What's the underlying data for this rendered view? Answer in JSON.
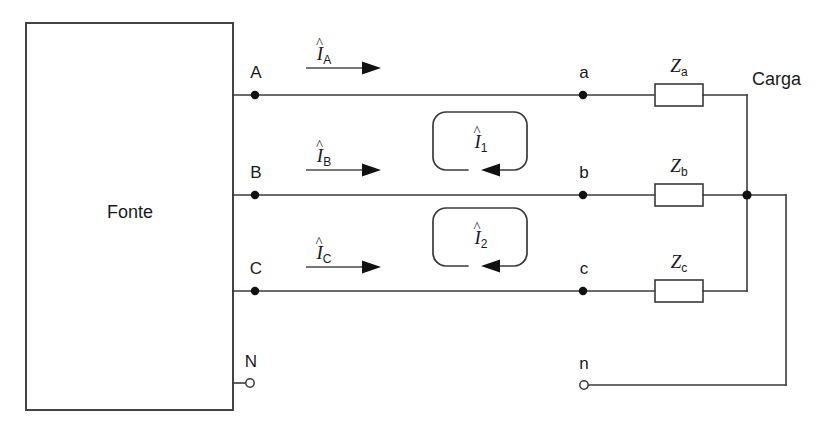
{
  "diagram": {
    "type": "three-phase source-load circuit schematic",
    "source_block": {
      "label": "Fonte",
      "terminals": [
        {
          "name": "A",
          "kind": "filled-node",
          "x": 255,
          "y": 95
        },
        {
          "name": "B",
          "kind": "filled-node",
          "x": 255,
          "y": 195
        },
        {
          "name": "C",
          "kind": "filled-node",
          "x": 255,
          "y": 291
        },
        {
          "name": "N",
          "kind": "open-terminal",
          "x": 250,
          "y": 383
        }
      ]
    },
    "load_block": {
      "label": "Carga",
      "terminals": [
        {
          "name": "a",
          "kind": "filled-node",
          "x": 583,
          "y": 95
        },
        {
          "name": "b",
          "kind": "filled-node",
          "x": 583,
          "y": 195
        },
        {
          "name": "c",
          "kind": "filled-node",
          "x": 583,
          "y": 291
        },
        {
          "name": "n",
          "kind": "open-terminal",
          "x": 582,
          "y": 385
        }
      ],
      "impedances": [
        {
          "symbol": "Z",
          "subscript": "a",
          "line": "a"
        },
        {
          "symbol": "Z",
          "subscript": "b",
          "line": "b"
        },
        {
          "symbol": "Z",
          "subscript": "c",
          "line": "c"
        }
      ]
    },
    "line_currents": [
      {
        "symbol": "I",
        "subscript": "A",
        "hat": "^",
        "direction": "right",
        "line": "A"
      },
      {
        "symbol": "I",
        "subscript": "B",
        "hat": "^",
        "direction": "right",
        "line": "B"
      },
      {
        "symbol": "I",
        "subscript": "C",
        "hat": "^",
        "direction": "right",
        "line": "C"
      }
    ],
    "mesh_currents": [
      {
        "symbol": "I",
        "subscript": "1",
        "hat": "^",
        "sense": "clockwise",
        "between_lines": "A-B"
      },
      {
        "symbol": "I",
        "subscript": "2",
        "hat": "^",
        "sense": "clockwise",
        "between_lines": "B-C"
      }
    ],
    "labels": {
      "source": "Fonte",
      "load": "Carga",
      "node_A": "A",
      "node_B": "B",
      "node_C": "C",
      "node_N": "N",
      "node_a": "a",
      "node_b": "b",
      "node_c": "c",
      "node_n": "n",
      "Z": "Z",
      "Za_sub": "a",
      "Zb_sub": "b",
      "Zc_sub": "c",
      "I": "I",
      "hat": "^",
      "IA_sub": "A",
      "IB_sub": "B",
      "IC_sub": "C",
      "I1_sub": "1",
      "I2_sub": "2"
    },
    "colors": {
      "wire": "#3a3a3a",
      "node": "#111111",
      "text": "#1a1a1a",
      "background": "#ffffff"
    }
  }
}
